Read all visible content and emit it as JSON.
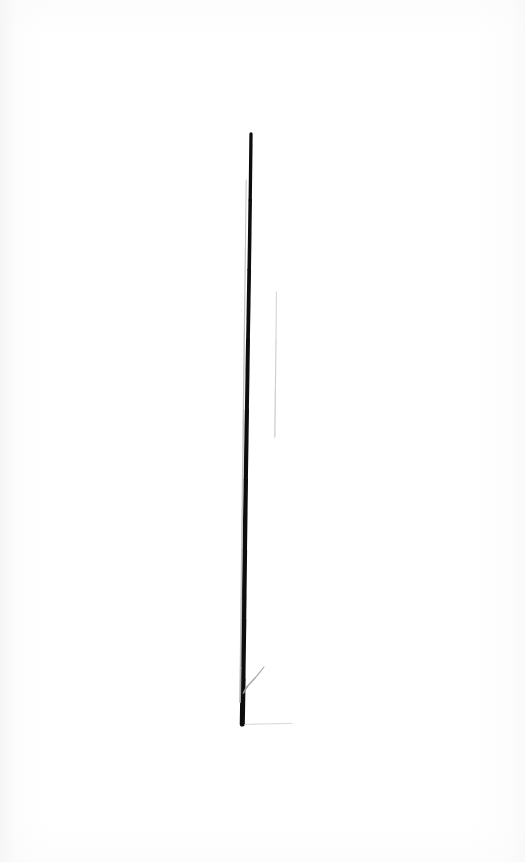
{
  "image": {
    "kind": "scanned-drawing",
    "title": "Single vertical ink line on white paper",
    "width": 525,
    "height": 862,
    "background_color": "#ffffff",
    "ink_color": "#0d0d0d",
    "ghost_color": "#b9b9bb",
    "faint_color": "#cfcfd2",
    "smudge_color": "#d8d8da",
    "caption": "",
    "alt_text": "A long, slightly leaning dark vertical line drawn on a white sheet, with a faint parallel ghost stroke, a short detached vertical hairline to its right, and a small diagonal tick branching from near its base."
  },
  "strokes": [
    {
      "name": "main-stem",
      "role": "primary ink line",
      "color": "#0d0d0d",
      "opacity": 1,
      "width_top": 3.2,
      "width_bottom": 5.2,
      "points": [
        [
          251.0,
          134.0
        ],
        [
          250.2,
          200.0
        ],
        [
          249.2,
          270.0
        ],
        [
          248.0,
          340.0
        ],
        [
          246.9,
          410.0
        ],
        [
          245.8,
          480.0
        ],
        [
          244.8,
          550.0
        ],
        [
          243.9,
          620.0
        ],
        [
          243.0,
          680.0
        ],
        [
          242.3,
          724.0
        ]
      ]
    },
    {
      "name": "ghost-stem",
      "role": "faint parallel pencil stroke",
      "color": "#b9b9bb",
      "opacity": 0.85,
      "width_top": 1.0,
      "width_bottom": 2.0,
      "points": [
        [
          246.2,
          180.0
        ],
        [
          245.4,
          250.0
        ],
        [
          244.4,
          330.0
        ],
        [
          243.3,
          420.0
        ],
        [
          242.3,
          510.0
        ],
        [
          241.3,
          600.0
        ],
        [
          240.6,
          668.0
        ],
        [
          240.0,
          702.0
        ]
      ]
    },
    {
      "name": "detached-hairline",
      "role": "faint detached vertical hairline",
      "color": "#cfcfd2",
      "opacity": 0.95,
      "width_top": 0.9,
      "width_bottom": 1.5,
      "points": [
        [
          276.4,
          292.0
        ],
        [
          276.0,
          340.0
        ],
        [
          275.4,
          390.0
        ],
        [
          274.8,
          437.0
        ]
      ]
    },
    {
      "name": "base-branch-tick",
      "role": "short diagonal branch near base",
      "color": "#9b9b9e",
      "opacity": 0.9,
      "width_top": 0.9,
      "width_bottom": 1.8,
      "points": [
        [
          264.0,
          667.0
        ],
        [
          255.0,
          678.0
        ],
        [
          247.0,
          687.0
        ],
        [
          243.4,
          693.0
        ]
      ]
    },
    {
      "name": "base-smudge",
      "role": "faint horizontal smudge at base",
      "color": "#d8d8da",
      "opacity": 0.9,
      "width_top": 1.2,
      "width_bottom": 1.2,
      "points": [
        [
          245.0,
          724.5
        ],
        [
          262.0,
          724.0
        ],
        [
          278.0,
          723.6
        ],
        [
          292.0,
          723.4
        ]
      ]
    }
  ],
  "measurements": {
    "stem_top_y": 134,
    "stem_bottom_y": 724,
    "stem_length_px": 590,
    "stem_lean_px": -8.7,
    "hairline_top_y": 292,
    "hairline_bottom_y": 437,
    "hairline_length_px": 145
  }
}
